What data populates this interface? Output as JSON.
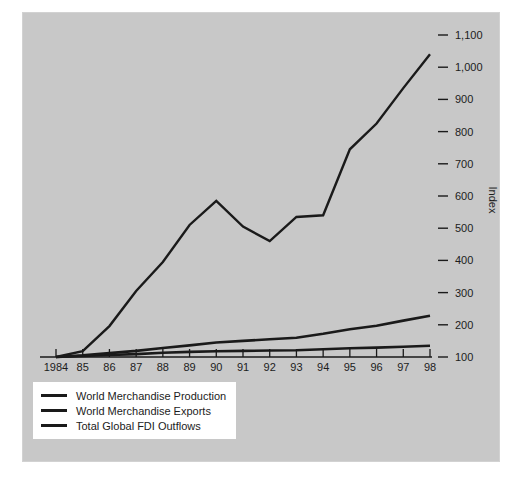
{
  "chart_data": {
    "type": "line",
    "title": "",
    "xlabel": "",
    "ylabel": "Index",
    "x": [
      1984,
      1985,
      1986,
      1987,
      1988,
      1989,
      1990,
      1991,
      1992,
      1993,
      1994,
      1995,
      1996,
      1997,
      1998
    ],
    "x_tick_labels": [
      "1984",
      "85",
      "86",
      "87",
      "88",
      "89",
      "90",
      "91",
      "92",
      "93",
      "94",
      "95",
      "96",
      "97",
      "98"
    ],
    "y_tick_values": [
      100,
      200,
      300,
      400,
      500,
      600,
      700,
      800,
      900,
      1000,
      1100
    ],
    "y_tick_labels": [
      "100",
      "200",
      "300",
      "400",
      "500",
      "600",
      "700",
      "800",
      "900",
      "1,000",
      "1,100"
    ],
    "ylim": [
      100,
      1130
    ],
    "grid": false,
    "legend_position": "bottom-left",
    "series": [
      {
        "name": "World Merchandise Production",
        "values": [
          100,
          103,
          106,
          109,
          113,
          116,
          118,
          119,
          120,
          121,
          124,
          127,
          129,
          132,
          135
        ]
      },
      {
        "name": "World Merchandise Exports",
        "values": [
          100,
          105,
          112,
          119,
          128,
          136,
          145,
          150,
          155,
          160,
          172,
          186,
          197,
          213,
          228
        ]
      },
      {
        "name": "Total Global FDI Outflows",
        "values": [
          100,
          118,
          196,
          305,
          395,
          510,
          585,
          505,
          460,
          535,
          540,
          745,
          825,
          935,
          1040
        ]
      }
    ]
  },
  "colors": {
    "panel_background": "#c8c8c8",
    "page_background": "#ffffff",
    "line": "#1a1a1a",
    "text": "#1c1c1c",
    "legend_background": "#ffffff"
  },
  "legend": {
    "items": [
      {
        "label": "World Merchandise Production"
      },
      {
        "label": "World Merchandise Exports"
      },
      {
        "label": "Total Global FDI Outflows"
      }
    ]
  }
}
